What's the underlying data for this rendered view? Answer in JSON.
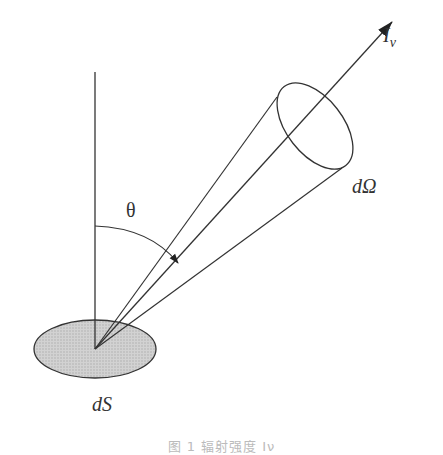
{
  "diagram": {
    "labels": {
      "intensity_main": "I",
      "intensity_sub": "ν",
      "solid_angle": "dΩ",
      "surface": "dS",
      "angle": "θ"
    },
    "elements": [
      {
        "id": "surface-element",
        "kind": "ellipse",
        "label": "dS",
        "fill": "#c8c8c8"
      },
      {
        "id": "normal-line",
        "kind": "line",
        "description": "surface normal (vertical)"
      },
      {
        "id": "ray-arrow",
        "kind": "arrow",
        "label": "I_ν"
      },
      {
        "id": "solid-angle-cone",
        "kind": "cone",
        "label": "dΩ"
      },
      {
        "id": "theta-arc",
        "kind": "arc-arrow",
        "label": "θ"
      }
    ],
    "colors": {
      "stroke": "#333333",
      "surface_fill": "#c8c8c8"
    }
  },
  "caption": {
    "text": "图 1   辐射强度 Iν"
  }
}
